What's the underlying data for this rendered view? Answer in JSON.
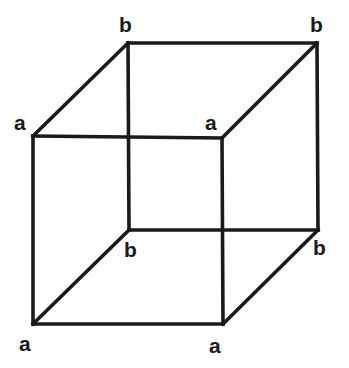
{
  "figure": {
    "type": "wireframe-cube",
    "width": 349,
    "height": 368,
    "background_color": "#ffffff",
    "line_color": "#1a1a1a",
    "line_width": 3.6,
    "label_color": "#1a1a1a",
    "label_font_size": 21,
    "label_font_weight": "bold"
  },
  "vertices": [
    {
      "id": "front-top-left",
      "label": "a",
      "x": 33,
      "y": 136,
      "label_x": 14,
      "label_y": 112
    },
    {
      "id": "front-top-right",
      "label": "a",
      "x": 222,
      "y": 138,
      "label_x": 205,
      "label_y": 112
    },
    {
      "id": "front-bottom-left",
      "label": "a",
      "x": 33,
      "y": 324,
      "label_x": 19,
      "label_y": 333
    },
    {
      "id": "front-bottom-right",
      "label": "a",
      "x": 223,
      "y": 324,
      "label_x": 209,
      "label_y": 335
    },
    {
      "id": "back-top-left",
      "label": "b",
      "x": 128,
      "y": 43,
      "label_x": 119,
      "label_y": 14
    },
    {
      "id": "back-top-right",
      "label": "b",
      "x": 317,
      "y": 43,
      "label_x": 310,
      "label_y": 14
    },
    {
      "id": "back-bottom-left",
      "label": "b",
      "x": 129,
      "y": 230,
      "label_x": 124,
      "label_y": 239
    },
    {
      "id": "back-bottom-right",
      "label": "b",
      "x": 318,
      "y": 230,
      "label_x": 313,
      "label_y": 237
    }
  ],
  "edges": [
    {
      "id": "front-top",
      "from": "front-top-left",
      "to": "front-top-right",
      "d": "M 33 136 L 222 138"
    },
    {
      "id": "front-right",
      "from": "front-top-right",
      "to": "front-bottom-right",
      "d": "M 222 138 L 223 324"
    },
    {
      "id": "front-bottom",
      "from": "front-bottom-right",
      "to": "front-bottom-left",
      "d": "M 223 324 L 33 324"
    },
    {
      "id": "front-left",
      "from": "front-bottom-left",
      "to": "front-top-left",
      "d": "M 33 324 L 33 136"
    },
    {
      "id": "back-top",
      "from": "back-top-left",
      "to": "back-top-right",
      "d": "M 128 43 L 317 43"
    },
    {
      "id": "back-right",
      "from": "back-top-right",
      "to": "back-bottom-right",
      "d": "M 317 43 L 318 230"
    },
    {
      "id": "back-bottom",
      "from": "back-bottom-right",
      "to": "back-bottom-left",
      "d": "M 318 230 L 129 230"
    },
    {
      "id": "back-left",
      "from": "back-bottom-left",
      "to": "back-top-left",
      "d": "M 129 230 L 128 43"
    },
    {
      "id": "connect-top-left",
      "from": "front-top-left",
      "to": "back-top-left",
      "d": "M 33 136 L 128 43"
    },
    {
      "id": "connect-top-right",
      "from": "front-top-right",
      "to": "back-top-right",
      "d": "M 222 138 L 317 43"
    },
    {
      "id": "connect-bottom-left",
      "from": "front-bottom-left",
      "to": "back-bottom-left",
      "d": "M 33 324 L 129 230"
    },
    {
      "id": "connect-bottom-right",
      "from": "front-bottom-right",
      "to": "back-bottom-right",
      "d": "M 223 324 L 318 230"
    }
  ]
}
